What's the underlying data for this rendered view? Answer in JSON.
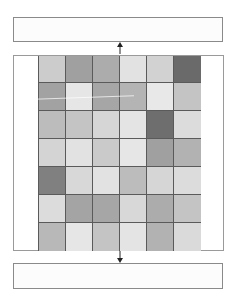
{
  "diagram": {
    "top_box": {
      "label": ""
    },
    "bottom_box": {
      "label": ""
    },
    "arrows": [
      {
        "id": "arrow-up",
        "direction": "up",
        "from": "grid",
        "to": "top_box"
      },
      {
        "id": "arrow-down",
        "direction": "down",
        "from": "grid",
        "to": "bottom_box"
      }
    ],
    "grid": {
      "columns": 6,
      "rows": 7,
      "cells": [
        [
          "#cccccc",
          "#a0a0a0",
          "#acacac",
          "#e2e2e2",
          "#d2d2d2",
          "#6a6a6a"
        ],
        [
          "#a2a2a2",
          "#e6e6e6",
          "#a6a6a6",
          "#b4b4b4",
          "#e8e8e8",
          "#c4c4c4"
        ],
        [
          "#bcbcbc",
          "#c4c4c4",
          "#d6d6d6",
          "#e4e4e4",
          "#6e6e6e",
          "#dcdcdc"
        ],
        [
          "#d4d4d4",
          "#e2e2e2",
          "#cacaca",
          "#e6e6e6",
          "#a0a0a0",
          "#b2b2b2"
        ],
        [
          "#808080",
          "#d8d8d8",
          "#e2e2e2",
          "#bcbcbc",
          "#d6d6d6",
          "#dcdcdc"
        ],
        [
          "#dcdcdc",
          "#a4a4a4",
          "#a6a6a6",
          "#d8d8d8",
          "#acacac",
          "#c4c4c4"
        ],
        [
          "#b8b8b8",
          "#e6e6e6",
          "#c4c4c4",
          "#e4e4e4",
          "#b2b2b2",
          "#dadada"
        ]
      ]
    },
    "colors": {
      "box_border": "#8a8a8a",
      "grid_line": "#5a5a5a",
      "arrow": "#222222"
    }
  }
}
